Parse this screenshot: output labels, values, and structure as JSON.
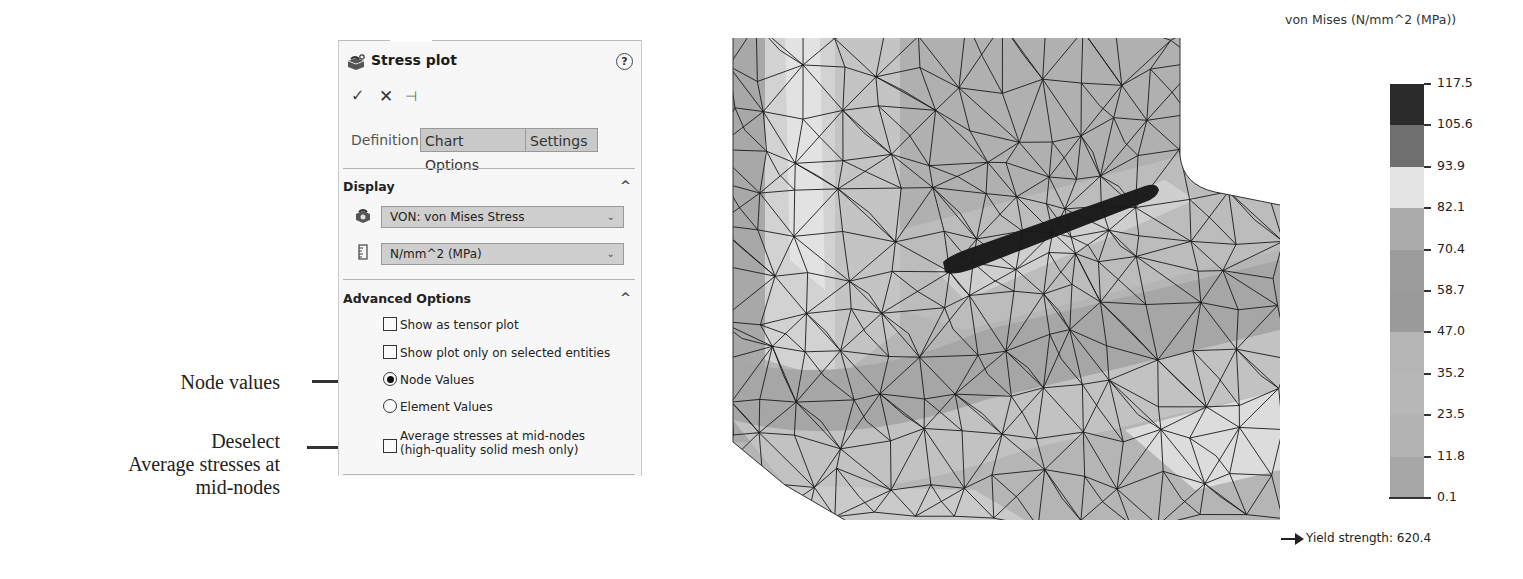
{
  "annotations": {
    "node_values": "Node values",
    "deselect_line1": "Deselect",
    "deselect_line2": "Average stresses at",
    "deselect_line3": "mid-nodes"
  },
  "panel": {
    "title": "Stress plot",
    "title_icon": "stress-plot-icon",
    "help_icon": "help-icon",
    "help_glyph": "?",
    "actions": {
      "ok_glyph": "✓",
      "cancel_glyph": "✕",
      "pin_glyph": "⊣"
    },
    "tabs": [
      {
        "label": "Definition",
        "active": true
      },
      {
        "label": "Chart Options",
        "active": false
      },
      {
        "label": "Settings",
        "active": false
      }
    ],
    "display": {
      "heading": "Display",
      "collapse_glyph": "^",
      "component_select": "VON: von Mises Stress",
      "units_select": "N/mm^2 (MPa)",
      "caret_glyph": "⌄"
    },
    "advanced": {
      "heading": "Advanced Options",
      "collapse_glyph": "^",
      "options": [
        {
          "type": "checkbox",
          "label": "Show as tensor plot",
          "checked": false
        },
        {
          "type": "checkbox",
          "label": "Show plot only on selected entities",
          "checked": false
        },
        {
          "type": "radio",
          "label": "Node Values",
          "checked": true
        },
        {
          "type": "radio",
          "label": "Element Values",
          "checked": false
        },
        {
          "type": "checkbox",
          "label": "Average stresses at mid-nodes",
          "label2": "(high-quality solid mesh only)",
          "checked": false
        }
      ]
    }
  },
  "legend": {
    "title": "von Mises (N/mm^2 (MPa))",
    "ticks": [
      "117.5",
      "105.6",
      "93.9",
      "82.1",
      "70.4",
      "58.7",
      "47.0",
      "35.2",
      "23.5",
      "11.8",
      "0.1"
    ],
    "band_colors": [
      "#2b2b2b",
      "#6f6f6f",
      "#e4e4e4",
      "#ababab",
      "#9c9c9c",
      "#9a9a9a",
      "#b5b5b5",
      "#b7b7b7",
      "#b3b3b3",
      "#a6a6a6"
    ],
    "yield_strength": "Yield strength: 620.4"
  }
}
